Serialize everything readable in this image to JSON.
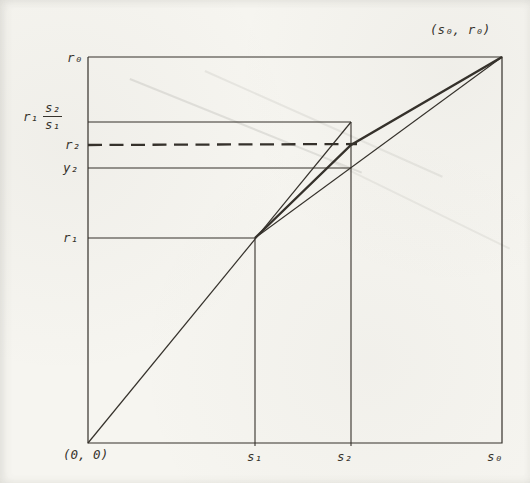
{
  "figure": {
    "paper_color": "#f6f5f0",
    "ink_color": "#35312b",
    "labels": {
      "corner_point": "(s₀, r₀)",
      "origin_point": "(0, 0)",
      "r0": "r₀",
      "r1_frac_prefix": "r₁",
      "r1_frac_numerator": "s₂",
      "r1_frac_denominator": "s₁",
      "r2": "r₂",
      "y2": "y₂",
      "r1": "r₁",
      "s1": "s₁",
      "s2": "s₂",
      "s0": "s₀"
    },
    "geometry": {
      "canvas_size": [
        530,
        483
      ],
      "lines": [
        {
          "name": "axis-box",
          "style": "solid",
          "width": 1.2,
          "points": [
            [
              88,
              57
            ],
            [
              502,
              57
            ],
            [
              502,
              443
            ],
            [
              88,
              443
            ],
            [
              88,
              57
            ]
          ]
        },
        {
          "name": "s1-vertical-line",
          "style": "solid",
          "width": 1.1,
          "points": [
            [
              255,
              238
            ],
            [
              255,
              446
            ]
          ]
        },
        {
          "name": "s2-vertical-line",
          "style": "solid",
          "width": 1.1,
          "points": [
            [
              351,
              122
            ],
            [
              351,
              446
            ]
          ]
        },
        {
          "name": "r1-horizontal-line",
          "style": "solid",
          "width": 1.1,
          "points": [
            [
              88,
              238
            ],
            [
              255,
              238
            ]
          ]
        },
        {
          "name": "y2-horizontal-line",
          "style": "solid",
          "width": 1.1,
          "points": [
            [
              88,
              168
            ],
            [
              351,
              168
            ]
          ]
        },
        {
          "name": "r1s2s1-horizontal-line",
          "style": "solid",
          "width": 1.1,
          "points": [
            [
              88,
              122
            ],
            [
              351,
              122
            ]
          ]
        },
        {
          "name": "origin-ray-line",
          "style": "solid",
          "width": 1.2,
          "points": [
            [
              88,
              443
            ],
            [
              351,
              122
            ]
          ]
        },
        {
          "name": "secant-line",
          "style": "solid",
          "width": 1.1,
          "points": [
            [
              255,
              238
            ],
            [
              502,
              57
            ]
          ]
        },
        {
          "name": "extrapolation-path-line",
          "style": "solid",
          "width": 2.4,
          "points": [
            [
              255,
              238
            ],
            [
              351,
              145
            ],
            [
              502,
              57
            ]
          ]
        },
        {
          "name": "r2-dashed-line",
          "style": "dashed",
          "width": 2.3,
          "dash": "14 7.5",
          "points": [
            [
              88,
              145
            ],
            [
              357,
              144
            ]
          ]
        }
      ]
    }
  }
}
